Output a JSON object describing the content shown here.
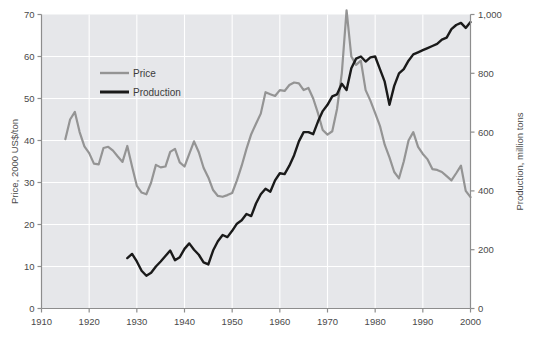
{
  "chart_data": {
    "type": "line",
    "title": "",
    "subtitle": "",
    "xlabel": "",
    "xlim": [
      1910,
      2000
    ],
    "xticks": [
      1910,
      1920,
      1930,
      1940,
      1950,
      1960,
      1970,
      1980,
      1990,
      2000
    ],
    "xtick_labels": [
      "1910",
      "1920",
      "1930",
      "1940",
      "1950",
      "1960",
      "1970",
      "1980",
      "1990",
      "2000"
    ],
    "grid": true,
    "grid_color": "#ffffff",
    "plot_background": "#e6e7ea",
    "legend_position": "upper-left-inside",
    "axes": [
      {
        "id": "left",
        "label": "Price, 2000 US$/ton",
        "ylim": [
          0,
          70
        ],
        "yticks": [
          0,
          10,
          20,
          30,
          40,
          50,
          60,
          70
        ],
        "ytick_labels": [
          "0",
          "10",
          "20",
          "30",
          "40",
          "50",
          "60",
          "70"
        ]
      },
      {
        "id": "right",
        "label": "Production, million tons",
        "ylim": [
          0,
          1000
        ],
        "yticks": [
          0,
          200,
          400,
          600,
          800,
          1000
        ],
        "ytick_labels": [
          "0",
          "200",
          "400",
          "600",
          "800",
          "1,000"
        ]
      }
    ],
    "series": [
      {
        "name": "Price",
        "axis": "left",
        "color": "#949494",
        "width": 2.2,
        "x": [
          1915,
          1916,
          1917,
          1918,
          1919,
          1920,
          1921,
          1922,
          1923,
          1924,
          1925,
          1926,
          1927,
          1928,
          1929,
          1930,
          1931,
          1932,
          1933,
          1934,
          1935,
          1936,
          1937,
          1938,
          1939,
          1940,
          1941,
          1942,
          1943,
          1944,
          1945,
          1946,
          1947,
          1948,
          1949,
          1950,
          1951,
          1952,
          1953,
          1954,
          1955,
          1956,
          1957,
          1958,
          1959,
          1960,
          1961,
          1962,
          1963,
          1964,
          1965,
          1966,
          1967,
          1968,
          1969,
          1970,
          1971,
          1972,
          1973,
          1974,
          1975,
          1976,
          1977,
          1978,
          1979,
          1980,
          1981,
          1982,
          1983,
          1984,
          1985,
          1986,
          1987,
          1988,
          1989,
          1990,
          1991,
          1992,
          1993,
          1994,
          1995,
          1996,
          1997,
          1998,
          1999,
          2000
        ],
        "y": [
          40.3,
          45.0,
          46.8,
          42.0,
          38.6,
          37.0,
          34.5,
          34.3,
          38.2,
          38.5,
          37.6,
          36.2,
          34.9,
          38.7,
          33.8,
          29.2,
          27.6,
          27.2,
          30.0,
          34.2,
          33.6,
          33.8,
          37.3,
          38.0,
          34.8,
          33.8,
          36.8,
          39.8,
          37.2,
          33.5,
          31.2,
          28.2,
          26.8,
          26.6,
          27.0,
          27.5,
          30.5,
          34.0,
          38.0,
          41.5,
          44.0,
          46.4,
          51.5,
          51.0,
          50.6,
          52.0,
          51.8,
          53.2,
          53.8,
          53.6,
          52.0,
          52.5,
          50.0,
          46.5,
          42.5,
          41.4,
          42.2,
          47.5,
          56.0,
          71.0,
          60.0,
          58.0,
          59.0,
          52.0,
          49.5,
          46.5,
          43.5,
          39.0,
          36.0,
          32.5,
          31.0,
          35.0,
          40.0,
          42.0,
          38.5,
          36.8,
          35.5,
          33.2,
          33.0,
          32.5,
          31.5,
          30.5,
          32.2,
          34.0,
          28.0,
          26.5
        ]
      },
      {
        "name": "Production",
        "axis": "left_scaled_to_right",
        "color": "#1a1a1a",
        "width": 2.4,
        "x": [
          1928,
          1929,
          1930,
          1931,
          1932,
          1933,
          1934,
          1935,
          1936,
          1937,
          1938,
          1939,
          1940,
          1941,
          1942,
          1943,
          1944,
          1945,
          1946,
          1947,
          1948,
          1949,
          1950,
          1951,
          1952,
          1953,
          1954,
          1955,
          1956,
          1957,
          1958,
          1959,
          1960,
          1961,
          1962,
          1963,
          1964,
          1965,
          1966,
          1967,
          1968,
          1969,
          1970,
          1971,
          1972,
          1973,
          1974,
          1975,
          1976,
          1977,
          1978,
          1979,
          1980,
          1981,
          1982,
          1983,
          1984,
          1985,
          1986,
          1987,
          1988,
          1989,
          1990,
          1991,
          1992,
          1993,
          1994,
          1995,
          1996,
          1997,
          1998,
          1999,
          2000
        ],
        "y_left": [
          12.0,
          13.0,
          11.2,
          9.0,
          7.8,
          8.5,
          10.0,
          11.2,
          12.5,
          13.8,
          11.5,
          12.2,
          14.2,
          15.5,
          14.0,
          12.8,
          11.0,
          10.5,
          13.8,
          16.0,
          17.5,
          17.0,
          18.5,
          20.2,
          21.0,
          22.5,
          22.0,
          25.0,
          27.2,
          28.5,
          27.8,
          30.5,
          32.2,
          32.0,
          34.0,
          36.5,
          39.8,
          42.0,
          42.0,
          41.5,
          44.5,
          47.0,
          48.5,
          50.5,
          51.0,
          53.5,
          52.0,
          57.2,
          59.5,
          60.0,
          58.8,
          59.8,
          60.0,
          57.0,
          54.0,
          48.5,
          53.0,
          56.0,
          57.0,
          59.0,
          60.5,
          61.0,
          61.5,
          62.0,
          62.5,
          63.0,
          64.0,
          64.5,
          66.5,
          67.5,
          68.0,
          66.8,
          68.2
        ],
        "y_right_mt": [
          171,
          186,
          160,
          129,
          111,
          121,
          143,
          160,
          179,
          197,
          164,
          174,
          203,
          221,
          200,
          183,
          157,
          150,
          197,
          229,
          250,
          243,
          264,
          289,
          300,
          321,
          314,
          357,
          389,
          407,
          397,
          436,
          460,
          457,
          486,
          521,
          569,
          600,
          600,
          593,
          636,
          671,
          693,
          721,
          729,
          764,
          743,
          817,
          850,
          857,
          840,
          854,
          857,
          814,
          771,
          693,
          757,
          800,
          814,
          843,
          864,
          871,
          879,
          886,
          893,
          900,
          914,
          921,
          950,
          964,
          971,
          954,
          974
        ]
      }
    ]
  },
  "legend": {
    "items": [
      {
        "label": "Price",
        "color": "#949494"
      },
      {
        "label": "Production",
        "color": "#1a1a1a"
      }
    ]
  }
}
